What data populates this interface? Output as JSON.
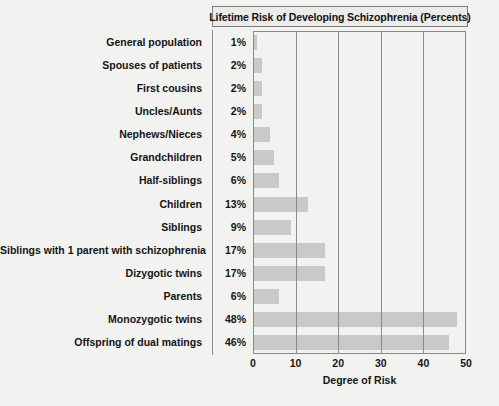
{
  "chart_data": {
    "type": "bar",
    "orientation": "horizontal",
    "title": "Lifetime Risk of Developing Schizophrenia (Percents)",
    "xlabel": "Degree of Risk",
    "ylabel": "",
    "xlim": [
      0,
      50
    ],
    "xticks": [
      0,
      10,
      20,
      30,
      40,
      50
    ],
    "gridlines": [
      10,
      20,
      30,
      40
    ],
    "grid": true,
    "legend": false,
    "bar_color": "#c9c9c7",
    "categories": [
      "General population",
      "Spouses of patients",
      "First cousins",
      "Uncles/Aunts",
      "Nephews/Nieces",
      "Grandchildren",
      "Half-siblings",
      "Children",
      "Siblings",
      "Siblings with 1 parent with schizophrenia",
      "Dizygotic twins",
      "Parents",
      "Monozygotic twins",
      "Offspring of dual matings"
    ],
    "values": [
      1,
      2,
      2,
      2,
      4,
      5,
      6,
      13,
      9,
      17,
      17,
      6,
      48,
      46
    ],
    "value_labels": [
      "1%",
      "2%",
      "2%",
      "2%",
      "4%",
      "5%",
      "6%",
      "13%",
      "9%",
      "17%",
      "17%",
      "6%",
      "48%",
      "46%"
    ]
  }
}
